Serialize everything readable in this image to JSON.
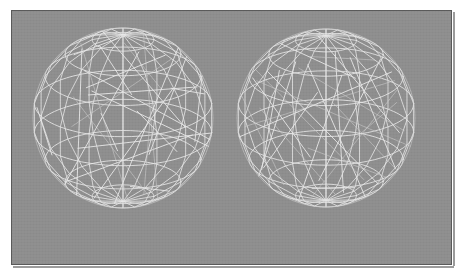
{
  "canvas": {
    "width": 464,
    "height": 277,
    "page_background": "#ffffff"
  },
  "panel": {
    "label": "wireframe render viewport",
    "x": 11,
    "y": 10,
    "width": 441,
    "height": 255,
    "background_color": "#8e8e8e",
    "border_color": "#5a5a5a",
    "border_width": 1,
    "shadow_color": "#9b9b9b"
  },
  "render": {
    "title": "",
    "line_color": "#e8e8e8",
    "line_color_dim": "#cfcfcf",
    "line_width": 1,
    "object_count": 2,
    "object_type": "wireframe-sphere"
  },
  "spheres": [
    {
      "name": "sphere-left",
      "cx": 123,
      "cy": 118,
      "r": 90,
      "lat_bands": 9,
      "lon_bands": 16,
      "tilt_deg": 22,
      "chord_count": 26,
      "seed": 7
    },
    {
      "name": "sphere-right",
      "cx": 326,
      "cy": 118,
      "r": 89,
      "lat_bands": 9,
      "lon_bands": 16,
      "tilt_deg": 22,
      "chord_count": 26,
      "seed": 31
    }
  ],
  "chart_data": {
    "type": "scatter",
    "xlabel": "",
    "ylabel": "",
    "categories": [
      "sphere-left",
      "sphere-right"
    ],
    "values": [
      90,
      89
    ],
    "annotations": [
      "Left sphere centered near (123,118) with radius ~90 px",
      "Right sphere centered near (326,118) with radius ~89 px",
      "Both drawn as light gray polylines on a flat mid-gray background"
    ]
  }
}
